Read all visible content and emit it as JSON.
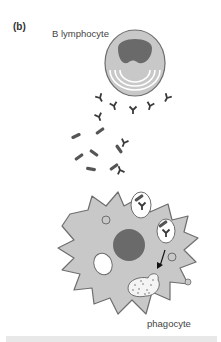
{
  "figure": {
    "panel_label": "(b)",
    "labels": {
      "b_cell": "B lymphocyte",
      "phagocyte": "phagocyte"
    },
    "colors": {
      "cell_fill": "#c8c8c8",
      "cell_outline": "#6e6e6e",
      "nucleus": "#6a6a6a",
      "antibody": "#3a3a3a",
      "bacterium": "#555555",
      "vesicle": "#ffffff",
      "bottom_bar": "#e8e8e8"
    },
    "elements": [
      "B lymphocyte with kidney-shaped nucleus and concentric arcs",
      "Y-shaped antibodies secreted from B lymphocyte",
      "Rod-shaped bacteria",
      "Antibody-coated bacteria being engulfed",
      "Phagocyte with nucleus, vacuoles and phagosomes",
      "Arrow from phagosome to digestion vesicle"
    ]
  }
}
